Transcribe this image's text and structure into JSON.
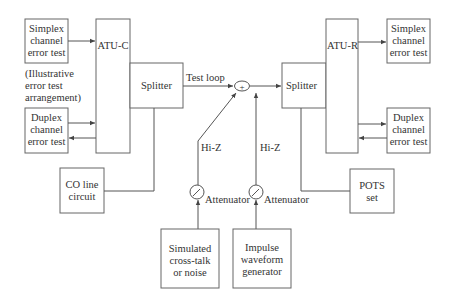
{
  "blocks": {
    "simplex_left": [
      "Simplex",
      "channel",
      "error test"
    ],
    "note": [
      "(Illustrative",
      "error  test",
      "arrangement)"
    ],
    "duplex_left": [
      "Duplex",
      "channel",
      "error test"
    ],
    "atu_c": "ATU-C",
    "splitter_left": "Splitter",
    "co_line": [
      "CO line",
      "circuit"
    ],
    "test_loop": "Test loop",
    "summer_symbol": "+",
    "splitter_right": "Splitter",
    "atu_r": "ATU-R",
    "simplex_right": [
      "Simplex",
      "channel",
      "error test"
    ],
    "duplex_right": [
      "Duplex",
      "channel",
      "error test"
    ],
    "pots": [
      "POTS",
      "set"
    ],
    "hiz_left": "Hi-Z",
    "hiz_right": "Hi-Z",
    "attenuator_left": "Attenuator",
    "attenuator_right": "Attenuator",
    "simulated": [
      "Simulated",
      "cross-talk",
      "or noise"
    ],
    "impulse": [
      "Impulse",
      "waveform",
      "generator"
    ]
  }
}
